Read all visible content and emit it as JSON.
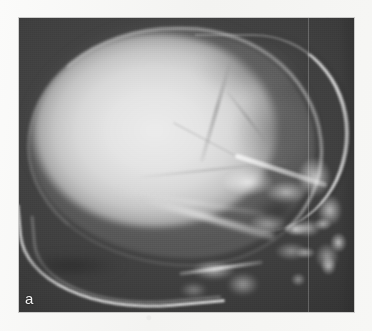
{
  "figure": {
    "panel_label": "a",
    "modality": "plain radiograph",
    "projection": "lateral",
    "body_region": "skull",
    "caption": ""
  },
  "colors": {
    "page_background": "#f6f6f4",
    "film_background": "#3b3b3b",
    "bone_bright": "#f5f5f5",
    "vault_interior": "#e4e4e4",
    "label_text": "#f2f2f2"
  },
  "anatomy": {
    "structures": [
      {
        "name": "cranial-vault",
        "label": "cranial vault"
      },
      {
        "name": "outer-table-rim",
        "label": "outer table of calvarium"
      },
      {
        "name": "frontal-outer-table",
        "label": "frontal bone outer table"
      },
      {
        "name": "coronal-suture",
        "label": "coronal suture"
      },
      {
        "name": "lambdoid-suture",
        "label": "lambdoid suture"
      },
      {
        "name": "squamous-suture",
        "label": "squamous suture"
      },
      {
        "name": "occipital-curve",
        "label": "occipital bone / posterior skull base"
      },
      {
        "name": "petrous-ridge",
        "label": "petrous ridge"
      },
      {
        "name": "sella-shadow",
        "label": "sella turcica region"
      },
      {
        "name": "orbital-roof",
        "label": "orbital roof"
      },
      {
        "name": "mastoid-cluster",
        "label": "mastoid air cells"
      },
      {
        "name": "facial-mass",
        "label": "facial skeleton"
      },
      {
        "name": "mandible-ramus",
        "label": "mandibular ramus"
      }
    ]
  },
  "artifacts": {
    "fold_line": "vertical scan fold line",
    "film_grain": "film grain"
  }
}
